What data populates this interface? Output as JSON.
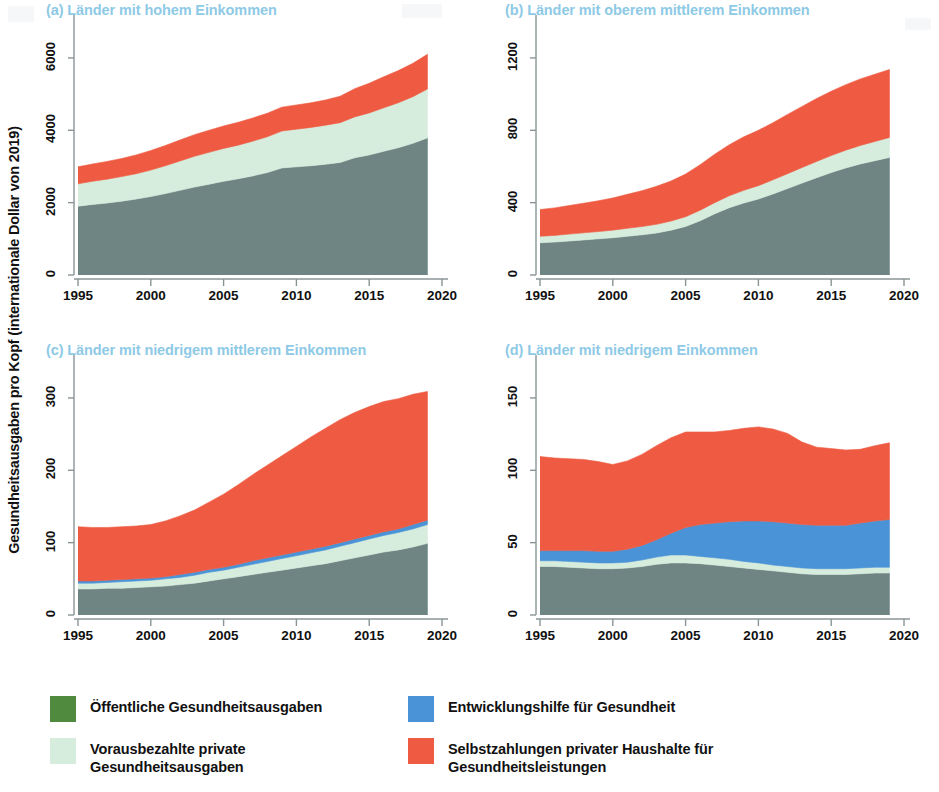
{
  "figure": {
    "y_axis_label": "Gesundheitsausgaben pro Kopf (internationale Dollar von 2019)",
    "colors": {
      "public": "#6e8584",
      "prepaid_private": "#d6ecdd",
      "development_aid": "#4a93d6",
      "out_of_pocket": "#ee5b42",
      "legend_public_swatch": "#4f8a3f",
      "title": "#8ecae6",
      "axis": "#8a9496"
    }
  },
  "legend": {
    "items": [
      {
        "label": "Öffentliche Gesundheitsausgaben",
        "color": "#4f8a3f",
        "key": "public"
      },
      {
        "label": "Vorausbezahlte private\nGesundheitsausgaben",
        "color": "#d6ecdd",
        "key": "prepaid_private"
      },
      {
        "label": "Entwicklungshilfe für Gesundheit",
        "color": "#4a93d6",
        "key": "development_aid"
      },
      {
        "label": "Selbstzahlungen privater Haushalte für\nGesundheitsleistungen",
        "color": "#ee5b42",
        "key": "out_of_pocket"
      }
    ]
  },
  "chart_data": [
    {
      "id": "a",
      "type": "area",
      "stacked": true,
      "title": "(a) Länder mit hohem Einkommen",
      "xlabel": "",
      "ylabel": "Gesundheitsausgaben pro Kopf (internationale Dollar von 2019)",
      "xlim": [
        1995,
        2020
      ],
      "ylim": [
        0,
        6800
      ],
      "xticks": [
        1995,
        2000,
        2005,
        2010,
        2015,
        2020
      ],
      "yticks": [
        0,
        2000,
        4000,
        6000
      ],
      "grid": false,
      "legend_position": "below-figure",
      "x": [
        1995,
        1996,
        1997,
        1998,
        1999,
        2000,
        2001,
        2002,
        2003,
        2004,
        2005,
        2006,
        2007,
        2008,
        2009,
        2010,
        2011,
        2012,
        2013,
        2014,
        2015,
        2016,
        2017,
        2018,
        2019
      ],
      "series": [
        {
          "name": "Öffentliche Gesundheitsausgaben",
          "key": "public",
          "color": "#6e8584",
          "values": [
            1900,
            1950,
            1990,
            2040,
            2100,
            2170,
            2250,
            2340,
            2430,
            2510,
            2590,
            2660,
            2740,
            2830,
            2960,
            2990,
            3020,
            3060,
            3110,
            3240,
            3320,
            3420,
            3520,
            3640,
            3790
          ]
        },
        {
          "name": "Vorausbezahlte private Gesundheitsausgaben",
          "key": "prepaid_private",
          "color": "#d6ecdd",
          "values": [
            620,
            640,
            660,
            680,
            700,
            730,
            770,
            810,
            850,
            880,
            910,
            930,
            960,
            990,
            1020,
            1040,
            1060,
            1080,
            1100,
            1130,
            1160,
            1200,
            1240,
            1290,
            1350
          ]
        },
        {
          "name": "Selbstzahlungen privater Haushalte für Gesundheitsleistungen",
          "key": "out_of_pocket",
          "color": "#ee5b42",
          "values": [
            470,
            480,
            490,
            500,
            520,
            540,
            560,
            580,
            600,
            610,
            620,
            630,
            640,
            650,
            660,
            670,
            680,
            700,
            730,
            780,
            820,
            860,
            890,
            920,
            960
          ]
        }
      ]
    },
    {
      "id": "b",
      "type": "area",
      "stacked": true,
      "title": "(b) Länder mit oberem mittlerem Einkommen",
      "xlabel": "",
      "ylabel": "Gesundheitsausgaben pro Kopf (internationale Dollar von 2019)",
      "xlim": [
        1995,
        2020
      ],
      "ylim": [
        0,
        1360
      ],
      "xticks": [
        1995,
        2000,
        2005,
        2010,
        2015,
        2020
      ],
      "yticks": [
        0,
        400,
        800,
        1200
      ],
      "grid": false,
      "legend_position": "below-figure",
      "x": [
        1995,
        1996,
        1997,
        1998,
        1999,
        2000,
        2001,
        2002,
        2003,
        2004,
        2005,
        2006,
        2007,
        2008,
        2009,
        2010,
        2011,
        2012,
        2013,
        2014,
        2015,
        2016,
        2017,
        2018,
        2019
      ],
      "series": [
        {
          "name": "Öffentliche Gesundheitsausgaben",
          "key": "public",
          "color": "#6e8584",
          "values": [
            178,
            182,
            188,
            194,
            200,
            206,
            214,
            222,
            232,
            248,
            268,
            300,
            338,
            372,
            398,
            420,
            448,
            478,
            508,
            538,
            566,
            592,
            614,
            632,
            650
          ]
        },
        {
          "name": "Vorausbezahlte private Gesundheitsausgaben",
          "key": "prepaid_private",
          "color": "#d6ecdd",
          "values": [
            36,
            37,
            38,
            39,
            40,
            42,
            44,
            46,
            48,
            50,
            54,
            58,
            62,
            66,
            70,
            74,
            78,
            82,
            86,
            90,
            94,
            98,
            102,
            106,
            110
          ]
        },
        {
          "name": "Selbstzahlungen privater Haushalte für Gesundheitsleistungen",
          "key": "out_of_pocket",
          "color": "#ee5b42",
          "values": [
            148,
            152,
            158,
            164,
            170,
            178,
            188,
            198,
            210,
            222,
            236,
            252,
            268,
            282,
            296,
            306,
            316,
            328,
            338,
            348,
            356,
            362,
            368,
            372,
            376
          ]
        }
      ]
    },
    {
      "id": "c",
      "type": "area",
      "stacked": true,
      "title": "(c) Länder mit niedrigem mittlerem Einkommen",
      "xlabel": "",
      "ylabel": "Gesundheitsausgaben pro Kopf (internationale Dollar von 2019)",
      "xlim": [
        1995,
        2020
      ],
      "ylim": [
        0,
        340
      ],
      "xticks": [
        1995,
        2000,
        2005,
        2010,
        2015,
        2020
      ],
      "yticks": [
        0,
        100,
        200,
        300
      ],
      "grid": false,
      "legend_position": "below-figure",
      "x": [
        1995,
        1996,
        1997,
        1998,
        1999,
        2000,
        2001,
        2002,
        2003,
        2004,
        2005,
        2006,
        2007,
        2008,
        2009,
        2010,
        2011,
        2012,
        2013,
        2014,
        2015,
        2016,
        2017,
        2018,
        2019
      ],
      "series": [
        {
          "name": "Öffentliche Gesundheitsausgaben",
          "key": "public",
          "color": "#6e8584",
          "values": [
            36,
            36,
            37,
            37,
            38,
            39,
            40,
            42,
            44,
            47,
            50,
            53,
            56,
            59,
            62,
            65,
            68,
            71,
            75,
            79,
            83,
            87,
            90,
            94,
            99
          ]
        },
        {
          "name": "Vorausbezahlte private Gesundheitsausgaben",
          "key": "prepaid_private",
          "color": "#d6ecdd",
          "values": [
            8,
            8,
            8,
            9,
            9,
            9,
            10,
            10,
            11,
            12,
            12,
            13,
            14,
            15,
            16,
            17,
            18,
            19,
            20,
            21,
            22,
            23,
            24,
            25,
            26
          ]
        },
        {
          "name": "Entwicklungshilfe für Gesundheit",
          "key": "development_aid",
          "color": "#4a93d6",
          "values": [
            3,
            3,
            3,
            3,
            3,
            3,
            3,
            4,
            4,
            4,
            4,
            4,
            5,
            5,
            5,
            5,
            5,
            5,
            5,
            5,
            5,
            5,
            5,
            6,
            6
          ]
        },
        {
          "name": "Selbstzahlungen privater Haushalte für Gesundheitsleistungen",
          "key": "out_of_pocket",
          "color": "#ee5b42",
          "values": [
            75,
            74,
            73,
            73,
            73,
            74,
            77,
            81,
            86,
            93,
            101,
            110,
            119,
            128,
            137,
            146,
            155,
            163,
            170,
            175,
            178,
            180,
            180,
            180,
            178
          ]
        }
      ]
    },
    {
      "id": "d",
      "type": "area",
      "stacked": true,
      "title": "(d) Länder mit niedrigem Einkommen",
      "xlabel": "",
      "ylabel": "Gesundheitsausgaben pro Kopf (internationale Dollar von 2019)",
      "xlim": [
        1995,
        2020
      ],
      "ylim": [
        0,
        170
      ],
      "xticks": [
        1995,
        2000,
        2005,
        2010,
        2015,
        2020
      ],
      "yticks": [
        0,
        50,
        100,
        150
      ],
      "grid": false,
      "legend_position": "below-figure",
      "x": [
        1995,
        1996,
        1997,
        1998,
        1999,
        2000,
        2001,
        2002,
        2003,
        2004,
        2005,
        2006,
        2007,
        2008,
        2009,
        2010,
        2011,
        2012,
        2013,
        2014,
        2015,
        2016,
        2017,
        2018,
        2019
      ],
      "series": [
        {
          "name": "Öffentliche Gesundheitsausgaben",
          "key": "public",
          "color": "#6e8584",
          "values": [
            33.5,
            33.5,
            33,
            32.5,
            32,
            32,
            32.5,
            33.5,
            35,
            36,
            36,
            35.5,
            34.5,
            33.5,
            32.5,
            31.5,
            30.5,
            29.5,
            28.5,
            28,
            28,
            28,
            28.5,
            29,
            29
          ]
        },
        {
          "name": "Vorausbezahlte private Gesundheitsausgaben",
          "key": "prepaid_private",
          "color": "#d6ecdd",
          "values": [
            4,
            4,
            4,
            4,
            4,
            4,
            4,
            4.5,
            5,
            5.5,
            5.5,
            5,
            5,
            5,
            4.5,
            4.5,
            4,
            4,
            4,
            4,
            4,
            4,
            4,
            4,
            4
          ]
        },
        {
          "name": "Entwicklungshilfe für Gesundheit",
          "key": "development_aid",
          "color": "#4a93d6",
          "values": [
            7,
            7,
            7.5,
            8,
            8,
            8,
            9,
            10,
            12,
            15,
            19,
            22,
            24,
            26,
            28,
            29,
            30,
            30,
            30,
            30,
            30,
            30,
            31,
            32,
            33
          ]
        },
        {
          "name": "Selbstzahlungen privater Haushalte für Gesundheitsleistungen",
          "key": "out_of_pocket",
          "color": "#ee5b42",
          "values": [
            65,
            64,
            63.5,
            63,
            62,
            60,
            61,
            63,
            65,
            66,
            66,
            64,
            63,
            63,
            64,
            65,
            64,
            62,
            57,
            54,
            53,
            52,
            51,
            52,
            53
          ]
        }
      ]
    }
  ]
}
